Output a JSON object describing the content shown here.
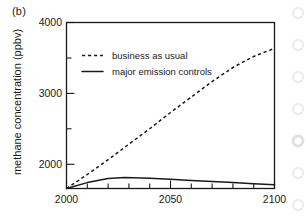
{
  "panel": {
    "label": "(b)"
  },
  "chart_data": {
    "type": "line",
    "title": "",
    "subtitle": "",
    "xlabel": "",
    "ylabel": "methane concentration (ppbv)",
    "xlim": [
      2000,
      2100
    ],
    "ylim": [
      1750,
      4000
    ],
    "grid": false,
    "legend_position": "upper-left-inside",
    "x_ticks_major": [
      2000,
      2050,
      2100
    ],
    "x_tick_labels": [
      "2000",
      "2050",
      "2100"
    ],
    "x_ticks_minor": [
      2010,
      2020,
      2030,
      2040,
      2060,
      2070,
      2080,
      2090
    ],
    "y_ticks_major": [
      2000,
      3000,
      4000
    ],
    "y_tick_labels": [
      "2000",
      "3000",
      "4000"
    ],
    "y_ticks_minor": [
      2500,
      3500
    ],
    "series": [
      {
        "name": "business as usual",
        "style": "dashed",
        "color": "#1a1a1a",
        "x": [
          2000,
          2010,
          2020,
          2030,
          2040,
          2050,
          2060,
          2070,
          2080,
          2090,
          2100
        ],
        "values": [
          1750,
          1940,
          2140,
          2350,
          2560,
          2780,
          2990,
          3200,
          3390,
          3540,
          3650
        ]
      },
      {
        "name": "major emission controls",
        "style": "solid",
        "color": "#1a1a1a",
        "x": [
          2000,
          2010,
          2020,
          2028,
          2040,
          2050,
          2060,
          2070,
          2080,
          2090,
          2100
        ],
        "values": [
          1750,
          1830,
          1885,
          1900,
          1890,
          1875,
          1860,
          1845,
          1830,
          1815,
          1800
        ]
      }
    ]
  },
  "legend": {
    "entries": [
      {
        "label": "business as usual",
        "style": "dashed"
      },
      {
        "label": "major emission controls",
        "style": "solid"
      }
    ]
  },
  "axis_text": {
    "x_0": "2000",
    "x_1": "2050",
    "x_2": "2100",
    "y_0": "2000",
    "y_1": "3000",
    "y_2": "4000"
  }
}
